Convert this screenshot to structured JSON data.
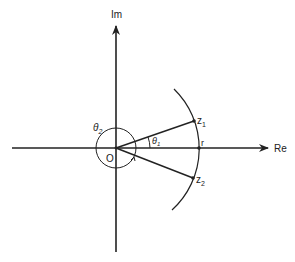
{
  "diagram": {
    "axes": {
      "real_label": "Re",
      "imag_label": "Im",
      "origin_label": "O"
    },
    "points": [
      {
        "label": "z",
        "sub": "1"
      },
      {
        "label": "z",
        "sub": "2"
      }
    ],
    "radius_label": "r",
    "angles": [
      {
        "label": "θ",
        "sub": "1"
      },
      {
        "label": "θ",
        "sub": "2"
      }
    ],
    "colors": {
      "ink": "#222222",
      "background": "#ffffff"
    }
  }
}
